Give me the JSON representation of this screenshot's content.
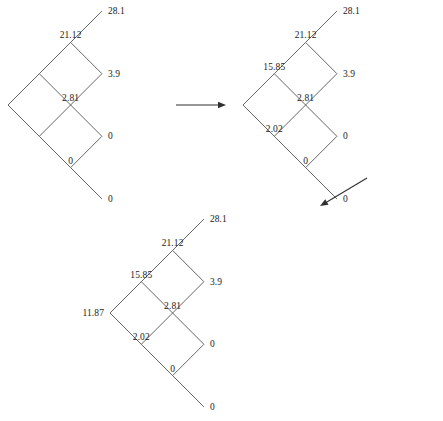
{
  "figure": {
    "type": "binomial-lattice-backward-induction",
    "stage_count": 3,
    "step_x": 31.3,
    "step_y": 31.3,
    "line_color": "#555555",
    "text_color": "#1a1a1a",
    "background": "#ffffff"
  },
  "trees": [
    {
      "id": "tree-1",
      "name": "lattice-stage-1",
      "origin_x": 8,
      "origin_y": 105,
      "terminal_labels": [
        {
          "name": "terminal-value-up-up-up",
          "text": "28.1",
          "col": 3,
          "level": 3,
          "pos": "right"
        },
        {
          "name": "terminal-value-up-up-down",
          "text": "3.9",
          "col": 3,
          "level": 1,
          "pos": "right"
        },
        {
          "name": "terminal-value-up-down-down",
          "text": "0",
          "col": 3,
          "level": -1,
          "pos": "right"
        },
        {
          "name": "terminal-value-down-down-down",
          "text": "0",
          "col": 3,
          "level": -3,
          "pos": "right"
        }
      ],
      "interior_labels": [
        {
          "name": "node-value-2-up",
          "text": "21.12",
          "col": 2,
          "level": 2,
          "pos": "above"
        },
        {
          "name": "node-value-2-mid",
          "text": "2.81",
          "col": 2,
          "level": 0,
          "pos": "above"
        },
        {
          "name": "node-value-2-down",
          "text": "0",
          "col": 2,
          "level": -2,
          "pos": "above"
        }
      ]
    },
    {
      "id": "tree-2",
      "name": "lattice-stage-2",
      "origin_x": 243,
      "origin_y": 105,
      "terminal_labels": [
        {
          "name": "terminal-value-up-up-up",
          "text": "28.1",
          "col": 3,
          "level": 3,
          "pos": "right"
        },
        {
          "name": "terminal-value-up-up-down",
          "text": "3.9",
          "col": 3,
          "level": 1,
          "pos": "right"
        },
        {
          "name": "terminal-value-up-down-down",
          "text": "0",
          "col": 3,
          "level": -1,
          "pos": "right"
        },
        {
          "name": "terminal-value-down-down-down",
          "text": "0",
          "col": 3,
          "level": -3,
          "pos": "right"
        }
      ],
      "interior_labels": [
        {
          "name": "node-value-2-up",
          "text": "21.12",
          "col": 2,
          "level": 2,
          "pos": "above"
        },
        {
          "name": "node-value-2-mid",
          "text": "2.81",
          "col": 2,
          "level": 0,
          "pos": "above"
        },
        {
          "name": "node-value-2-down",
          "text": "0",
          "col": 2,
          "level": -2,
          "pos": "above"
        },
        {
          "name": "node-value-1-up",
          "text": "15.85",
          "col": 1,
          "level": 1,
          "pos": "above"
        },
        {
          "name": "node-value-1-down",
          "text": "2.02",
          "col": 1,
          "level": -1,
          "pos": "above"
        }
      ]
    },
    {
      "id": "tree-3",
      "name": "lattice-stage-3",
      "origin_x": 110,
      "origin_y": 313,
      "terminal_labels": [
        {
          "name": "terminal-value-up-up-up",
          "text": "28.1",
          "col": 3,
          "level": 3,
          "pos": "right"
        },
        {
          "name": "terminal-value-up-up-down",
          "text": "3.9",
          "col": 3,
          "level": 1,
          "pos": "right"
        },
        {
          "name": "terminal-value-up-down-down",
          "text": "0",
          "col": 3,
          "level": -1,
          "pos": "right"
        },
        {
          "name": "terminal-value-down-down-down",
          "text": "0",
          "col": 3,
          "level": -3,
          "pos": "right"
        }
      ],
      "interior_labels": [
        {
          "name": "node-value-2-up",
          "text": "21.12",
          "col": 2,
          "level": 2,
          "pos": "above"
        },
        {
          "name": "node-value-2-mid",
          "text": "2.81",
          "col": 2,
          "level": 0,
          "pos": "above"
        },
        {
          "name": "node-value-2-down",
          "text": "0",
          "col": 2,
          "level": -2,
          "pos": "above"
        },
        {
          "name": "node-value-1-up",
          "text": "15.85",
          "col": 1,
          "level": 1,
          "pos": "above"
        },
        {
          "name": "node-value-1-down",
          "text": "2.02",
          "col": 1,
          "level": -1,
          "pos": "above"
        },
        {
          "name": "node-value-root",
          "text": "11.87",
          "col": 0,
          "level": 0,
          "pos": "left"
        }
      ]
    }
  ],
  "arrows": [
    {
      "name": "arrow-stage1-to-stage2",
      "direction": "right",
      "x1": 176,
      "y1": 105,
      "x2": 226,
      "y2": 105
    },
    {
      "name": "arrow-stage2-to-stage3",
      "direction": "down-left",
      "x1": 367,
      "y1": 178,
      "x2": 320,
      "y2": 206
    }
  ]
}
